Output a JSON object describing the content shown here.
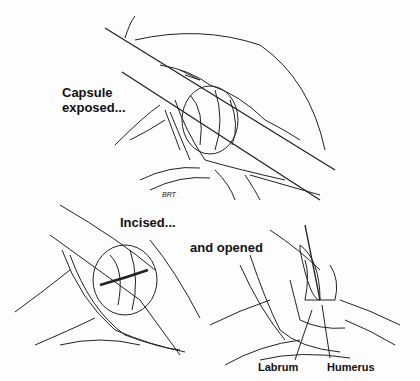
{
  "figure": {
    "panels": [
      {
        "id": "top",
        "caption_line1": "Capsule",
        "caption_line2": "exposed..."
      },
      {
        "id": "bottom-left",
        "caption": "Incised..."
      },
      {
        "id": "bottom-right",
        "caption": "and opened"
      }
    ],
    "annotations": {
      "labrum": "Labrum",
      "humerus": "Humerus"
    },
    "signature": "BRT"
  }
}
